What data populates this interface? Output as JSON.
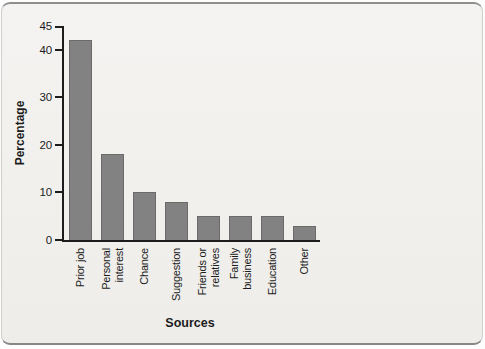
{
  "figure": {
    "background_color": "#f1f0ed",
    "rule_color": "#8e8e8e"
  },
  "chart_data": {
    "type": "bar",
    "title": "",
    "xlabel": "Sources",
    "ylabel": "Percentage",
    "categories": [
      "Prior job",
      "Personal\ninterest",
      "Chance",
      "Suggestion",
      "Friends or\nrelatives",
      "Family\nbusiness",
      "Education",
      "Other"
    ],
    "values": [
      42,
      18,
      10,
      8,
      5,
      5,
      5,
      3
    ],
    "yticks": [
      0,
      10,
      20,
      30,
      40,
      45
    ],
    "ylim": [
      0,
      45
    ],
    "bar_color": "#828282",
    "bar_border_color": "#6b6b6b",
    "axis_color": "#1c1c1c",
    "grid": false,
    "legend": false
  }
}
